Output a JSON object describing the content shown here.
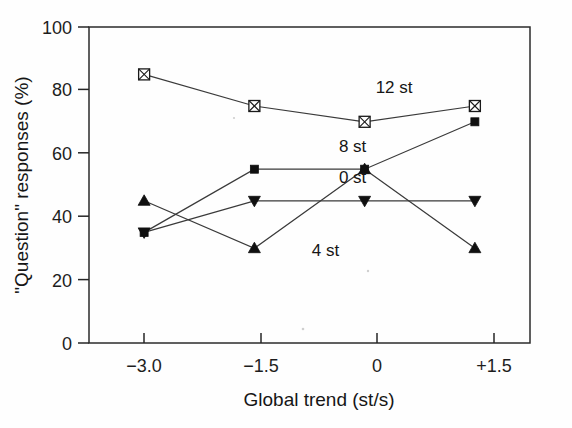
{
  "chart_data": {
    "type": "line",
    "title": "",
    "xlabel": "Global trend (st/s)",
    "ylabel": "\"Question\" responses (%)",
    "x": [
      -3.0,
      -1.5,
      0,
      1.5
    ],
    "xtick_labels": [
      "−3.0",
      "−1.5",
      "0",
      "+1.5"
    ],
    "ytick_labels": [
      "0",
      "20",
      "40",
      "60",
      "80",
      "100"
    ],
    "ytick_values": [
      0,
      20,
      40,
      60,
      80,
      100
    ],
    "xlim": [
      -3.75,
      2.25
    ],
    "ylim": [
      0,
      100
    ],
    "grid": false,
    "legend_position": "inline-annotations",
    "series": [
      {
        "name": "12 st",
        "label": "12 st",
        "marker": "crossed-square",
        "color": "#1a1a1a",
        "values": [
          85,
          75,
          70,
          75
        ]
      },
      {
        "name": "8 st",
        "label": "8 st",
        "marker": "filled-square",
        "color": "#101010",
        "values": [
          35,
          55,
          55,
          70
        ]
      },
      {
        "name": "0 st",
        "label": "0 st",
        "marker": "filled-triangle-down",
        "color": "#101010",
        "values": [
          35,
          45,
          45,
          45
        ]
      },
      {
        "name": "4 st",
        "label": "4 st",
        "marker": "filled-triangle-up",
        "color": "#101010",
        "values": [
          45,
          30,
          55,
          30
        ]
      }
    ],
    "annotations": [
      {
        "text": "12 st",
        "x": 0.15,
        "y": 79
      },
      {
        "text": "8 st",
        "x": -0.35,
        "y": 60.5
      },
      {
        "text": "0 st",
        "x": -0.35,
        "y": 50.5
      },
      {
        "text": "4 st",
        "x": -0.72,
        "y": 27.5
      }
    ]
  }
}
